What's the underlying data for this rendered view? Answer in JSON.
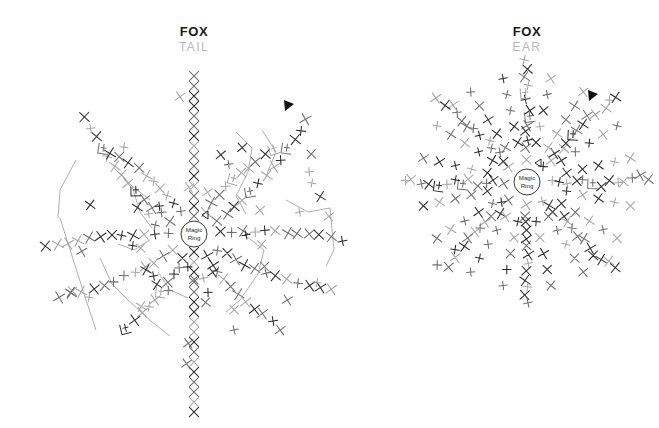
{
  "page": {
    "background": "#ffffff",
    "width": 659,
    "height": 428
  },
  "charts": [
    {
      "id": "fox-tail",
      "title_main": "FOX",
      "title_sub": "TAIL",
      "center_label_line1": "Magic",
      "center_label_line2": "Ring",
      "center": [
        194,
        234
      ],
      "ring_radius": 13,
      "marker": "start-arrow",
      "symbol_legend": [
        "x",
        "+",
        "bracket",
        "triangle"
      ],
      "colors": {
        "stitch_dark": "#2b2b2b",
        "stitch_mid": "#6e6e6e",
        "stitch_light": "#a6a6a6",
        "connector": "#9a9a9a",
        "title": "#1a1a1a",
        "subtitle": "#b8b8b8"
      }
    },
    {
      "id": "fox-ear",
      "title_main": "FOX",
      "title_sub": "EAR",
      "center_label_line1": "Magic",
      "center_label_line2": "Ring",
      "center": [
        527,
        182
      ],
      "ring_radius": 13,
      "marker": "start-arrow",
      "symbol_legend": [
        "x",
        "+",
        "bracket",
        "triangle"
      ],
      "colors": {
        "stitch_dark": "#2b2b2b",
        "stitch_mid": "#6e6e6e",
        "stitch_light": "#a6a6a6",
        "connector": "#9a9a9a",
        "title": "#1a1a1a",
        "subtitle": "#b8b8b8"
      }
    }
  ],
  "chart_data": {
    "type": "scatter",
    "subtitle": "",
    "xlabel": "",
    "ylabel": "",
    "grid": false,
    "legend": "none",
    "xlim": [
      0,
      659
    ],
    "ylim": [
      0,
      428
    ],
    "series": [
      {
        "name": "fox-tail-vertical-column",
        "note": "vertical stack of single-crochet X stitches through the tail centerline",
        "symbol": "x",
        "x": [
          194,
          194,
          194,
          194,
          194,
          194,
          194,
          194,
          194,
          194,
          194,
          194,
          194,
          194,
          194,
          194,
          194,
          194,
          194,
          194,
          194,
          194,
          194,
          194,
          194,
          194,
          194,
          194,
          194,
          194,
          194,
          194
        ],
        "y": [
          76,
          86,
          96,
          106,
          116,
          126,
          136,
          146,
          156,
          166,
          176,
          186,
          196,
          206,
          216,
          252,
          262,
          272,
          282,
          292,
          302,
          312,
          322,
          332,
          342,
          352,
          362,
          372,
          382,
          392,
          402,
          412
        ]
      },
      {
        "name": "fox-tail-arm-upper-right",
        "symbol": "x",
        "x": [
          206,
          216,
          226,
          236,
          246,
          256,
          264,
          272,
          278,
          284
        ],
        "y": [
          220,
          214,
          208,
          202,
          196,
          190,
          182,
          172,
          160,
          148
        ]
      },
      {
        "name": "fox-tail-arm-right",
        "symbol": "x",
        "x": [
          208,
          220,
          232,
          244,
          256,
          268,
          280,
          292,
          304,
          316,
          326
        ],
        "y": [
          228,
          226,
          224,
          222,
          220,
          218,
          216,
          214,
          212,
          210,
          208
        ]
      },
      {
        "name": "fox-tail-arm-lower-right",
        "symbol": "x",
        "x": [
          206,
          216,
          226,
          236,
          246,
          256,
          266,
          276,
          286,
          296
        ],
        "y": [
          246,
          252,
          258,
          264,
          270,
          276,
          282,
          288,
          294,
          300
        ]
      },
      {
        "name": "fox-tail-arm-left",
        "symbol": "x",
        "x": [
          182,
          170,
          158,
          146,
          134,
          122,
          110,
          98,
          86,
          72,
          60,
          48,
          38
        ],
        "y": [
          224,
          222,
          220,
          218,
          216,
          216,
          216,
          218,
          220,
          222,
          222,
          216,
          214
        ]
      },
      {
        "name": "fox-tail-arm-lower-left",
        "symbol": "x",
        "x": [
          180,
          168,
          156,
          144,
          132,
          120,
          108,
          96,
          84,
          72,
          62
        ],
        "y": [
          248,
          256,
          262,
          268,
          274,
          280,
          286,
          290,
          294,
          296,
          298
        ]
      },
      {
        "name": "fox-tail-arm-upper-left",
        "symbol": "x",
        "x": [
          180,
          168,
          156,
          146,
          136,
          126,
          118,
          110,
          104
        ],
        "y": [
          220,
          212,
          206,
          200,
          194,
          190,
          186,
          184,
          182
        ]
      },
      {
        "name": "fox-ear-radial-petals",
        "note": "eight radial petal arms of single crochet stitches around the magic ring",
        "symbol": "x",
        "arms": 8,
        "stitches_per_arm": 14,
        "x": [
          527
        ],
        "y": [
          182
        ]
      }
    ],
    "annotations": [
      {
        "text": "Magic Ring",
        "x": 194,
        "y": 234
      },
      {
        "text": "Magic Ring",
        "x": 527,
        "y": 182
      },
      {
        "text": "start-arrow",
        "x": 288,
        "y": 104
      },
      {
        "text": "start-arrow",
        "x": 592,
        "y": 94
      }
    ]
  }
}
